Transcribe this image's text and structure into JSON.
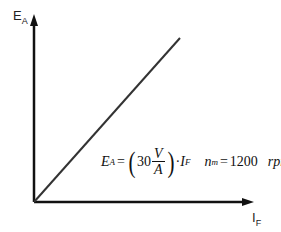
{
  "diagram": {
    "y_axis_label": {
      "main": "E",
      "sub": "A"
    },
    "x_axis_label": {
      "main": "I",
      "sub": "F"
    },
    "equation": {
      "lhs": "E",
      "lhs_sub": "A",
      "equals": "=",
      "coefficient": "30",
      "frac_num": "V",
      "frac_den": "A",
      "times": "·",
      "var": "I",
      "var_sub": "F",
      "speed_var": "n",
      "speed_sub": "m",
      "speed_eq": "=",
      "speed_value": "1200",
      "speed_unit": "rpm"
    },
    "colors": {
      "axis": "#111111",
      "line": "#333333"
    }
  }
}
